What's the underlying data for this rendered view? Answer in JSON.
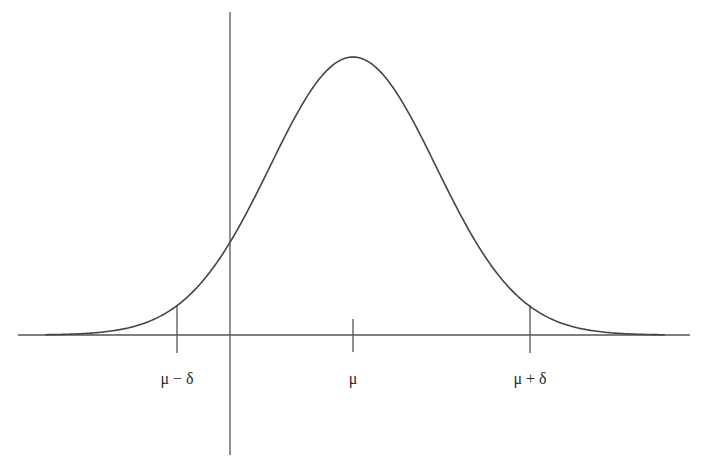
{
  "chart_data": {
    "type": "line",
    "title": "",
    "xlabel": "",
    "ylabel": "",
    "grid": false,
    "legend": null,
    "curve": {
      "distribution": "normal",
      "mean_label": "μ",
      "sigma_relative_to_delta": 0.47,
      "color": "#444444"
    },
    "tick_labels": [
      {
        "label": "μ − δ",
        "position": "mu-delta"
      },
      {
        "label": "μ",
        "position": "mu"
      },
      {
        "label": "μ + δ",
        "position": "mu+delta"
      }
    ],
    "vertical_axis_position": "between mu-delta and mu (approx. mu - 0.7*delta)"
  },
  "labels": {
    "mu_minus_delta": "μ − δ",
    "mu": "μ",
    "mu_plus_delta": "μ + δ"
  },
  "colors": {
    "axis": "#555555",
    "curve": "#444444",
    "text": "#2a2a2a",
    "background": "#ffffff"
  }
}
